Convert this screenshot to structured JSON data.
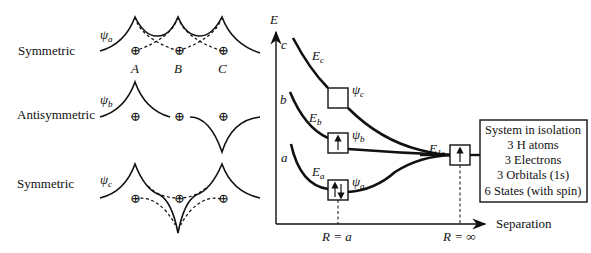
{
  "left_panel": {
    "rows": [
      {
        "label": "Symmetric",
        "psi": "ψ",
        "psi_sub": "a"
      },
      {
        "label": "Antisymmetric",
        "psi": "ψ",
        "psi_sub": "b"
      },
      {
        "label": "Symmetric",
        "psi": "ψ",
        "psi_sub": "c"
      }
    ],
    "nuclei_labels": [
      "A",
      "B",
      "C"
    ],
    "nucleus_symbol": "⊕"
  },
  "energy_diagram": {
    "y_axis_label": "E",
    "x_axis_label": "Separation",
    "curve_labels": [
      {
        "letter": "c",
        "energy": "E",
        "energy_sub": "c",
        "psi": "ψ",
        "psi_sub": "c",
        "box_electrons": ""
      },
      {
        "letter": "b",
        "energy": "E",
        "energy_sub": "b",
        "psi": "ψ",
        "psi_sub": "b",
        "box_electrons": "↑"
      },
      {
        "letter": "a",
        "energy": "E",
        "energy_sub": "a",
        "psi": "ψ",
        "psi_sub": "a",
        "box_electrons": "↑↓"
      }
    ],
    "isolated_level": {
      "energy": "E",
      "energy_sub": "1s",
      "box_electrons": "↑"
    },
    "x_markers": [
      "R = a",
      "R = ∞"
    ]
  },
  "info_box": {
    "lines": [
      "System in isolation",
      "3 H atoms",
      "3 Electrons",
      "3 Orbitals (1s)",
      "6 States (with spin)"
    ]
  }
}
